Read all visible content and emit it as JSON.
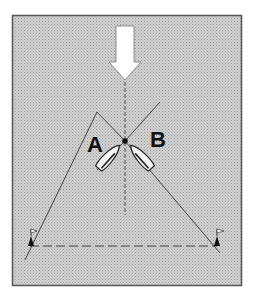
{
  "diagram": {
    "colors": {
      "background": "#c9c9c9",
      "frame": "#555555",
      "lines": "#333333",
      "boats": "#f4f4f4",
      "arrow": "#ffffff"
    },
    "labels": {
      "boat_a": "A",
      "boat_b": "B"
    },
    "elements": {
      "wind_arrow": "wind-direction-arrow-down",
      "start_line": "dashed line between two flag marks",
      "left_mark": "flag-buoy",
      "right_mark": "flag-buoy",
      "crossing_point": "dot"
    }
  }
}
